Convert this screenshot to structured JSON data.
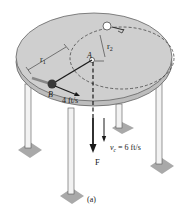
{
  "figure": {
    "caption": "(a)",
    "labels": {
      "point_a": "A",
      "point_b": "B",
      "radius_1": "r",
      "radius_1_sub": "1",
      "radius_2": "r",
      "radius_2_sub": "2",
      "speed_b": "4 ft/s",
      "force": "F",
      "speed_c": "v",
      "speed_c_sub": "c",
      "speed_c_value": " = 6 ft/s"
    },
    "colors": {
      "table_top": "#cfcfcf",
      "table_edge": "#bdbdbd",
      "leg": "#f2f2f2",
      "foot": "#a9a9a9",
      "ink": "#1a1a1a",
      "ball": "#3a3a3a"
    }
  }
}
